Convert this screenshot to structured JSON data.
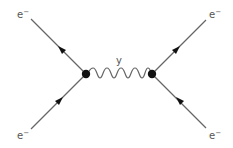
{
  "diagram": {
    "type": "feynman",
    "title": "",
    "colors": {
      "line": "#666666",
      "vertex": "#111111",
      "text": "#555555",
      "background": "#ffffff"
    },
    "vertices": [
      {
        "id": "v1",
        "x": 86,
        "y": 74
      },
      {
        "id": "v2",
        "x": 152,
        "y": 74
      }
    ],
    "propagator": {
      "type": "photon",
      "label": "y",
      "from": "v1",
      "to": "v2",
      "arches": 5
    },
    "fermions": [
      {
        "id": "top-left",
        "label": "e",
        "superscript": "−",
        "from": [
          30,
          20
        ],
        "to": "v1",
        "arrow": "toward-end-reversed"
      },
      {
        "id": "bottom-left",
        "label": "e",
        "superscript": "−",
        "from": [
          30,
          128
        ],
        "to": "v1",
        "arrow": "toward-vertex"
      },
      {
        "id": "top-right",
        "label": "e",
        "superscript": "−",
        "from": "v2",
        "to": [
          206,
          20
        ],
        "arrow": "away-from-vertex"
      },
      {
        "id": "bottom-right",
        "label": "e",
        "superscript": "−",
        "from": [
          206,
          128
        ],
        "to": "v2",
        "arrow": "toward-vertex"
      }
    ],
    "labels": {
      "top_left": "e",
      "top_right": "e",
      "bottom_left": "e",
      "bottom_right": "e",
      "sup": "−",
      "photon": "y"
    }
  }
}
